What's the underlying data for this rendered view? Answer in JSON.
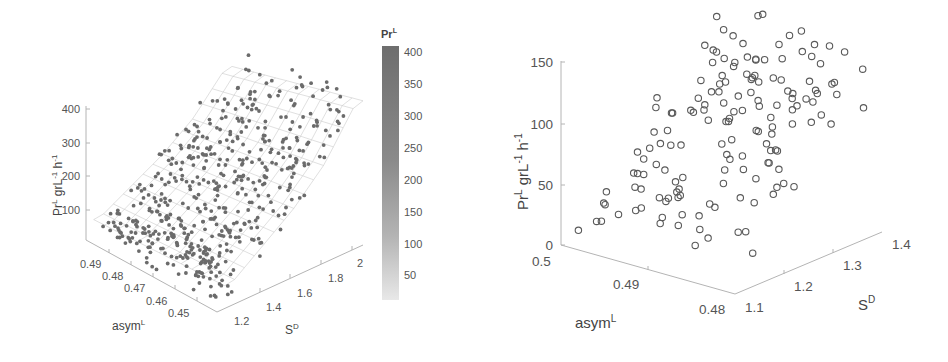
{
  "figure": {
    "left_panel": {
      "ylabel": "Pr",
      "ylabel_sup": "L",
      "ylabel_rest": " grL",
      "ylabel_exp1": "-1",
      "ylabel_h": " h",
      "ylabel_exp2": "-1",
      "xlabel": "asym",
      "xlabel_sup": "L",
      "zlabel": "S",
      "zlabel_sup": "D",
      "z_ticks": [
        "400",
        "300",
        "200",
        "100"
      ],
      "asym_ticks": [
        "0.49",
        "0.48",
        "0.47",
        "0.46",
        "0.45"
      ],
      "s_ticks": [
        "1.2",
        "1.4",
        "1.6",
        "1.8",
        "2"
      ],
      "colorbar": {
        "title": "Pr",
        "title_sup": "L",
        "ticks": [
          "400",
          "350",
          "300",
          "250",
          "200",
          "150",
          "100",
          "50"
        ],
        "color_high": "#6e6e6e",
        "color_low": "#e6e6e6"
      }
    },
    "right_panel": {
      "ylabel": "Pr",
      "ylabel_sup": "L",
      "ylabel_rest": " grL",
      "ylabel_exp1": "-1",
      "ylabel_h": " h",
      "ylabel_exp2": "-1",
      "xlabel": "asym",
      "xlabel_sup": "L",
      "zlabel": "S",
      "zlabel_sup": "D",
      "z_ticks": [
        "150",
        "100",
        "50",
        "0"
      ],
      "asym_ticks": [
        "0.5",
        "0.49",
        "0.48"
      ],
      "s_ticks": [
        "1.1",
        "1.2",
        "1.3",
        "1.4"
      ]
    }
  },
  "chart_data": [
    {
      "type": "scatter",
      "subtype": "3d-scatter-with-fitted-surface",
      "title": "",
      "xlabel": "asym^L",
      "ylabel": "S^D",
      "zlabel": "Pr^L grL^-1 h^-1",
      "x_range": [
        0.445,
        0.495
      ],
      "y_range": [
        1.1,
        2.05
      ],
      "z_range": [
        0,
        400
      ],
      "x_ticks": [
        0.45,
        0.46,
        0.47,
        0.48,
        0.49
      ],
      "y_ticks": [
        1.2,
        1.4,
        1.6,
        1.8,
        2.0
      ],
      "z_ticks": [
        100,
        200,
        300,
        400
      ],
      "colorbar": {
        "label": "Pr^L",
        "range": [
          0,
          400
        ],
        "ticks": [
          50,
          100,
          150,
          200,
          250,
          300,
          350,
          400
        ],
        "colormap": "gray (light=low, dark=high)"
      },
      "grid": false,
      "description": "Several hundred points; Pr^L rises with S^D from ~50 near S^D=1.2 to ~350-400 near S^D=2; mesh surface fitted over the points, peaking ~400 at high S^D.",
      "surface_trend": {
        "S_D": [
          1.2,
          1.4,
          1.6,
          1.8,
          2.0
        ],
        "Pr_L_approx": [
          60,
          120,
          180,
          260,
          380
        ]
      }
    },
    {
      "type": "scatter",
      "subtype": "3d-scatter",
      "title": "",
      "xlabel": "asym^L",
      "ylabel": "S^D",
      "zlabel": "Pr^L grL^-1 h^-1",
      "x_range": [
        0.48,
        0.5
      ],
      "y_range": [
        1.1,
        1.4
      ],
      "z_range": [
        0,
        150
      ],
      "x_ticks": [
        0.48,
        0.49,
        0.5
      ],
      "y_ticks": [
        1.1,
        1.2,
        1.3,
        1.4
      ],
      "z_ticks": [
        0,
        50,
        100,
        150
      ],
      "grid": false,
      "description": "~150 open-circle points; Pr^L increases from ~15-25 at low S^D to ~130-145 at S^D≈1.4.",
      "trend": {
        "S_D": [
          1.1,
          1.2,
          1.3,
          1.4
        ],
        "Pr_L_approx": [
          20,
          60,
          100,
          135
        ]
      }
    }
  ]
}
